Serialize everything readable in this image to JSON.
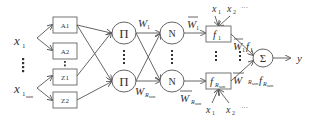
{
  "diagram": {
    "type": "anfis-network",
    "inputs": {
      "x1": "x",
      "x1_sub": "1",
      "xn": "x",
      "xn_sub": "1",
      "xn_subsub": "num",
      "vdots": "⋮"
    },
    "membership_layer": {
      "a1": "A1",
      "a2": "A2",
      "z1": "Z1",
      "z2": "Z2"
    },
    "rule_layer": {
      "symbol": "Π",
      "w1": "W",
      "w1_sub": "1",
      "wn": "W",
      "wn_sub": "R",
      "wn_subsub": "num"
    },
    "norm_layer": {
      "symbol": "N",
      "wbar1": "W",
      "wbar1_sub": "1",
      "wbarn": "W",
      "wbarn_sub": "R",
      "wbarn_subsub": "num"
    },
    "consequent_layer": {
      "f1": "f",
      "f1_sub": "1",
      "fn": "f",
      "fn_sub": "R",
      "fn_subsub": "num",
      "top_x1": "x",
      "top_x1_sub": "1",
      "top_x2": "x",
      "top_x2_sub": "2",
      "top_dots": "···",
      "bottom_x1": "x",
      "bottom_x1_sub": "1",
      "bottom_x2": "x",
      "bottom_x2_sub": "2",
      "bottom_dots": "···",
      "prod1": "W",
      "prod1_sub": "1",
      "prod1_f": "f",
      "prod1_f_sub": "1",
      "prodn": "W",
      "prodn_sub": "R",
      "prodn_subsub": "num",
      "prodn_f": "f",
      "prodn_f_sub": "R",
      "prodn_f_subsub": "num"
    },
    "output_layer": {
      "symbol": "Σ",
      "output": "y"
    }
  }
}
